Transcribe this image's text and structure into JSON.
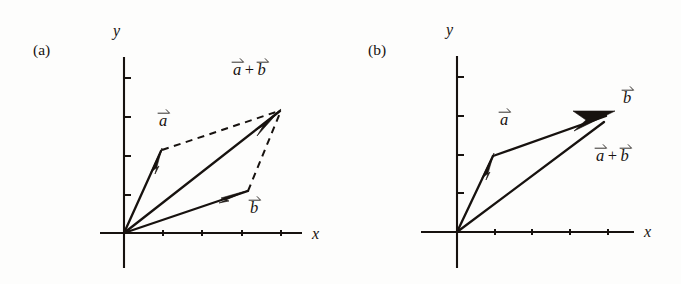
{
  "figure": {
    "kind": "vector-addition-diagram",
    "background_color": "#fdfdfc",
    "ink_color": "#17120f",
    "width": 681,
    "height": 284
  },
  "panels": [
    {
      "tag": "(a)",
      "method": "parallelogram-rule",
      "axes": {
        "x_label": "x",
        "y_label": "y",
        "origin": [
          124,
          233
        ],
        "x_axis": [
          100,
          233,
          302,
          233
        ],
        "y_axis": [
          124,
          57,
          124,
          268
        ],
        "x_ticks": [
          163,
          202,
          242,
          281
        ],
        "y_ticks": [
          78,
          117,
          156,
          195
        ],
        "tick_length": 6
      },
      "vectors": [
        {
          "name": "a",
          "label": "a",
          "style": "solid",
          "from": [
            124,
            233
          ],
          "to": [
            162,
            150
          ],
          "head_at": [
            159,
            158
          ]
        },
        {
          "name": "b",
          "label": "b",
          "style": "solid",
          "from": [
            124,
            233
          ],
          "to": [
            248,
            191
          ],
          "head_at": [
            243,
            193
          ]
        },
        {
          "name": "a_plus_b",
          "label": "a + b",
          "style": "solid",
          "from": [
            124,
            233
          ],
          "to": [
            281,
            110
          ],
          "head_at": [
            274,
            116
          ]
        }
      ],
      "construction_lines": [
        {
          "name": "a-to-resultant",
          "from": [
            162,
            150
          ],
          "to": [
            281,
            110
          ]
        },
        {
          "name": "b-to-resultant",
          "from": [
            248,
            191
          ],
          "to": [
            281,
            110
          ]
        }
      ],
      "labels": [
        {
          "name": "vector-a-label",
          "text": "a",
          "vector": true,
          "x": 158,
          "y": 113
        },
        {
          "name": "vector-b-label",
          "text": "b",
          "vector": true,
          "x": 249,
          "y": 200
        },
        {
          "name": "resultant-label",
          "text": "a + b",
          "vector": true,
          "x": 232,
          "y": 62
        },
        {
          "name": "x-axis-label",
          "text": "x",
          "x": 312,
          "y": 226
        },
        {
          "name": "y-axis-label",
          "text": "y",
          "x": 113,
          "y": 23
        },
        {
          "name": "panel-tag",
          "text": "(a)",
          "x": 33,
          "y": 42
        }
      ]
    },
    {
      "tag": "(b)",
      "method": "head-to-tail-rule",
      "axes": {
        "x_label": "x",
        "y_label": "y",
        "origin": [
          457,
          232
        ],
        "x_axis": [
          421,
          232,
          634,
          232
        ],
        "y_axis": [
          457,
          56,
          457,
          268
        ],
        "x_ticks": [
          495,
          532,
          570,
          608
        ],
        "y_ticks": [
          77,
          116,
          155,
          193
        ],
        "tick_length": 6
      },
      "vectors": [
        {
          "name": "a",
          "label": "a",
          "style": "solid",
          "from": [
            457,
            232
          ],
          "to": [
            494,
            155
          ],
          "head_at": [
            491,
            163
          ]
        },
        {
          "name": "b",
          "label": "b",
          "style": "solid",
          "from": [
            494,
            155
          ],
          "to": [
            614,
            112
          ],
          "head_at": [
            600,
            117
          ]
        },
        {
          "name": "a_plus_b",
          "label": "a + b",
          "style": "solid",
          "from": [
            457,
            232
          ],
          "to": [
            614,
            112
          ],
          "head_at": [
            599,
            123
          ]
        }
      ],
      "construction_lines": [],
      "labels": [
        {
          "name": "vector-a-label",
          "text": "a",
          "vector": true,
          "x": 499,
          "y": 112
        },
        {
          "name": "vector-b-label",
          "text": "b",
          "vector": true,
          "x": 622,
          "y": 90
        },
        {
          "name": "resultant-label",
          "text": "a + b",
          "vector": true,
          "x": 595,
          "y": 148
        },
        {
          "name": "x-axis-label",
          "text": "x",
          "x": 644,
          "y": 224
        },
        {
          "name": "y-axis-label",
          "text": "y",
          "x": 446,
          "y": 22
        },
        {
          "name": "panel-tag",
          "text": "(b)",
          "x": 368,
          "y": 42
        }
      ]
    }
  ],
  "notation": {
    "plus": "+",
    "arrow_accent": "vector-arrow-overline"
  }
}
